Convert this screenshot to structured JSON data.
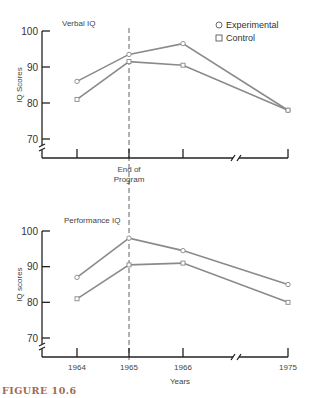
{
  "figure_label": "FIGURE 10.6",
  "legend": {
    "experimental": {
      "symbol": "circle-icon",
      "label": "Experimental"
    },
    "control": {
      "symbol": "square-icon",
      "label": "Control"
    }
  },
  "colors": {
    "line": "#8a8a8a",
    "axis": "#222222",
    "figure_label": "#a06a55"
  },
  "chart_data": [
    {
      "type": "line",
      "title": "Verbal IQ",
      "ylabel": "IQ Scores",
      "xlabel": "",
      "x_annotation": "End of Program",
      "annotation_x": "1965",
      "categories": [
        "1964",
        "1965",
        "1966",
        "1975"
      ],
      "show_x_tick_labels": false,
      "yticks": [
        70,
        80,
        90,
        100
      ],
      "ylim": [
        66,
        100
      ],
      "axis_break_x": true,
      "axis_break_y": true,
      "series": [
        {
          "name": "Experimental",
          "values": [
            86,
            93.5,
            96.5,
            78
          ]
        },
        {
          "name": "Control",
          "values": [
            81,
            91.5,
            90.5,
            78
          ]
        }
      ]
    },
    {
      "type": "line",
      "title": "Performance IQ",
      "ylabel": "IQ scores",
      "xlabel": "Years",
      "categories": [
        "1964",
        "1965",
        "1966",
        "1975"
      ],
      "show_x_tick_labels": true,
      "yticks": [
        70,
        80,
        90,
        100
      ],
      "ylim": [
        66,
        100
      ],
      "axis_break_x": true,
      "axis_break_y": true,
      "series": [
        {
          "name": "Experimental",
          "values": [
            87,
            98,
            94.5,
            85
          ]
        },
        {
          "name": "Control",
          "values": [
            81,
            90.5,
            91,
            80
          ]
        }
      ]
    }
  ]
}
